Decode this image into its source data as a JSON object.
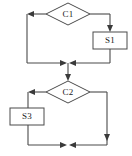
{
  "diagram": {
    "type": "flowchart",
    "title": "",
    "width": 132,
    "height": 156,
    "background_color": "#ffffff",
    "line_color": "#4a4a4a",
    "text_color": "#1a1a1a",
    "nodes": [
      {
        "id": "C1",
        "label": "C1",
        "shape": "diamond",
        "role": "decision",
        "cx": 68,
        "cy": 14,
        "rx": 22,
        "ry": 11
      },
      {
        "id": "S1",
        "label": "S1",
        "shape": "rectangle",
        "role": "process",
        "x": 93,
        "y": 32,
        "width": 34,
        "height": 17
      },
      {
        "id": "C2",
        "label": "C2",
        "shape": "diamond",
        "role": "decision",
        "cx": 68,
        "cy": 92,
        "rx": 22,
        "ry": 11
      },
      {
        "id": "S3",
        "label": "S3",
        "shape": "rectangle",
        "role": "process",
        "x": 10,
        "y": 108,
        "width": 34,
        "height": 17
      }
    ],
    "junctions": [
      {
        "id": "merge-upper",
        "x": 68,
        "y": 63
      },
      {
        "id": "merge-lower",
        "x": 68,
        "y": 145
      }
    ],
    "edges": [
      {
        "id": "c1-left-branch",
        "from": "C1",
        "to": "merge-upper",
        "path": "left-down",
        "arrow": "left"
      },
      {
        "id": "c1-right-to-s1",
        "from": "C1",
        "to": "S1",
        "path": "right-down",
        "arrow": "down"
      },
      {
        "id": "s1-to-merge-upper",
        "from": "S1",
        "to": "merge-upper",
        "path": "down-left",
        "arrow": "left"
      },
      {
        "id": "merge-upper-to-c2",
        "from": "merge-upper",
        "to": "C2",
        "path": "down",
        "arrow": "down"
      },
      {
        "id": "c2-left-to-s3",
        "from": "C2",
        "to": "S3",
        "path": "left-down",
        "arrow": "left"
      },
      {
        "id": "s3-to-merge-lower",
        "from": "S3",
        "to": "merge-lower",
        "path": "down-right",
        "arrow": "right"
      },
      {
        "id": "c2-right-branch",
        "from": "C2",
        "to": "merge-lower",
        "path": "right-down-left",
        "arrow": "left"
      }
    ]
  }
}
